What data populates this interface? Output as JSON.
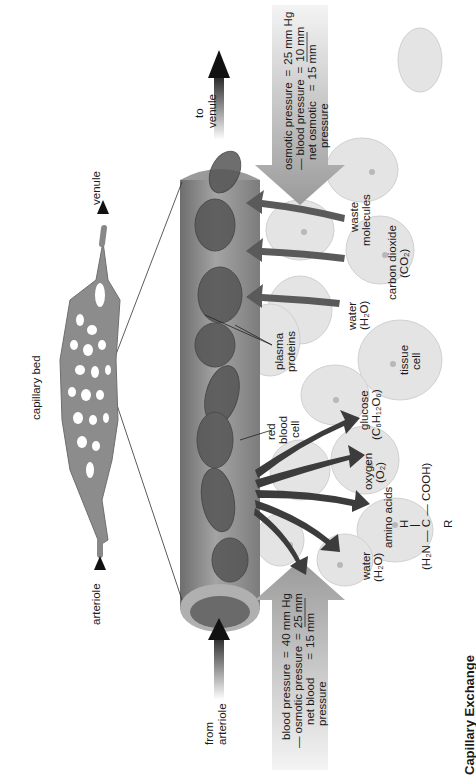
{
  "figure": {
    "title": "Capillary Exchange",
    "orientation": "rotated-90-ccw",
    "colors": {
      "background": "#ffffff",
      "vessel": "#8a8a8a",
      "tissue_cell": "#e2e2e2",
      "arrow_dark": "#3a3a3a",
      "pressure_arrow": "#a8a8a8",
      "text": "#1a1a1a"
    }
  },
  "overview": {
    "capillary_bed_label": "capillary bed",
    "arteriole_label": "arteriole",
    "venule_label": "venule"
  },
  "flow": {
    "from_arteriole_line1": "from",
    "from_arteriole_line2": "arteriole",
    "to_venule_line1": "to",
    "to_venule_line2": "venule"
  },
  "arterial_end": {
    "rows": [
      {
        "sign": "",
        "term": "blood pressure",
        "eq": "=",
        "value": "40 mm Hg"
      },
      {
        "sign": "—",
        "term": "osmotic pressure",
        "eq": "=",
        "value": "25 mm"
      },
      {
        "sign": "",
        "term": "net blood",
        "eq": "=",
        "value": "15 mm"
      },
      {
        "sign": "",
        "term": "pressure",
        "eq": "",
        "value": ""
      }
    ]
  },
  "venous_end": {
    "rows": [
      {
        "sign": "",
        "term": "osmotic pressure",
        "eq": "=",
        "value": "25 mm Hg"
      },
      {
        "sign": "—",
        "term": "blood pressure",
        "eq": "=",
        "value": "10 mm"
      },
      {
        "sign": "",
        "term": "net osmotic",
        "eq": "=",
        "value": "15 mm"
      },
      {
        "sign": "",
        "term": "pressure",
        "eq": "",
        "value": ""
      }
    ]
  },
  "labels": {
    "red_blood_cell": [
      "red",
      "blood",
      "cell"
    ],
    "plasma_proteins": [
      "plasma",
      "proteins"
    ],
    "tissue_cell": [
      "tissue",
      "cell"
    ],
    "water_out": [
      "water",
      "(H₂O)"
    ],
    "amino_acids": "amino acids",
    "amino_formula_h": "H",
    "amino_formula_bar": "|",
    "amino_formula_main": "(H₂N — C — COOH)",
    "amino_formula_r": "R",
    "oxygen": [
      "oxygen",
      "(O₂)"
    ],
    "glucose": [
      "glucose",
      "(C₆H₁₂O₆)"
    ],
    "water_in": [
      "water",
      "(H₂O)"
    ],
    "carbon_dioxide": [
      "carbon dioxide",
      "(CO₂)"
    ],
    "waste_molecules": [
      "waste",
      "molecules"
    ]
  }
}
